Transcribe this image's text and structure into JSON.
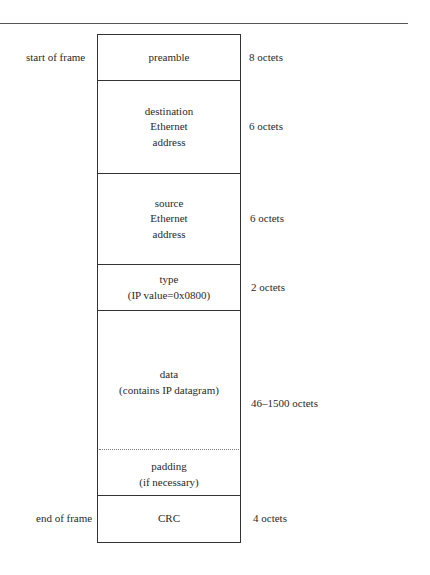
{
  "diagram": {
    "start_label": "start of frame",
    "end_label": "end of frame",
    "fields": [
      {
        "name": "preamble",
        "lines": [
          "preamble"
        ],
        "size": "8 octets"
      },
      {
        "name": "destination",
        "lines": [
          "destination",
          "Ethernet",
          "address"
        ],
        "size": "6 octets"
      },
      {
        "name": "source",
        "lines": [
          "source",
          "Ethernet",
          "address"
        ],
        "size": "6 octets"
      },
      {
        "name": "type",
        "lines": [
          "type",
          "(IP value=0x0800)"
        ],
        "size": "2 octets"
      },
      {
        "name": "data",
        "lines": [
          "data",
          "(contains IP datagram)"
        ],
        "size": "46–1500 octets"
      },
      {
        "name": "padding",
        "lines": [
          "padding",
          "(if necessary)"
        ],
        "size": ""
      },
      {
        "name": "crc",
        "lines": [
          "CRC"
        ],
        "size": "4 octets"
      }
    ]
  }
}
